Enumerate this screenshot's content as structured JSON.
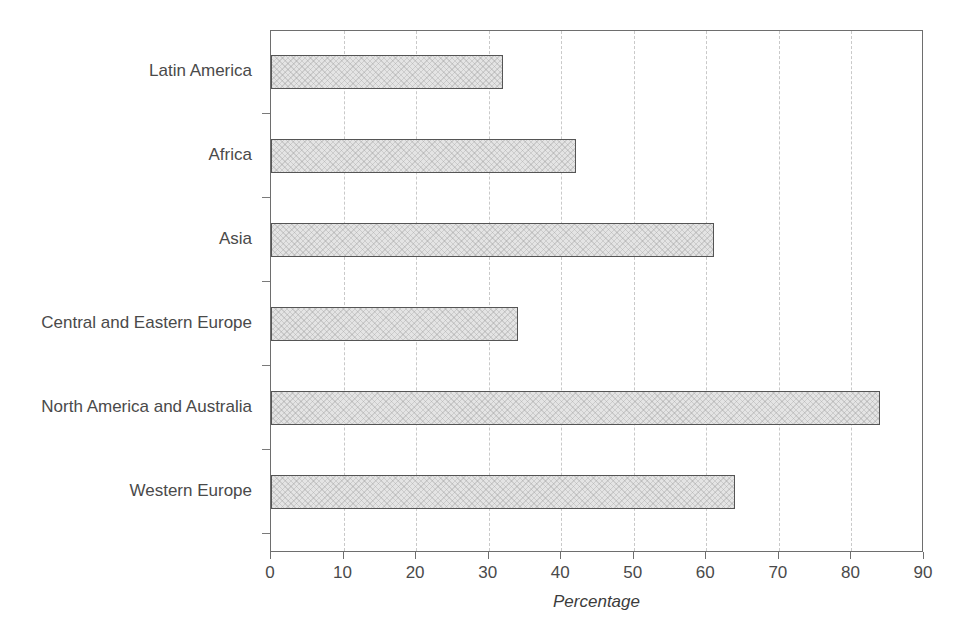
{
  "chart_data": {
    "type": "bar",
    "orientation": "horizontal",
    "title": "",
    "xlabel": "Percentage",
    "ylabel": "",
    "xlim": [
      0,
      90
    ],
    "ylim": null,
    "grid": true,
    "grid_axis": "x",
    "legend": false,
    "legend_position": "none",
    "categories": [
      "Latin America",
      "Africa",
      "Asia",
      "Central and Eastern Europe",
      "North America and Australia",
      "Western Europe"
    ],
    "values": [
      32,
      42,
      61,
      34,
      84,
      64
    ],
    "xticks": [
      0,
      10,
      20,
      30,
      40,
      50,
      60,
      70,
      80,
      90
    ],
    "xtick_labels": [
      "0",
      "10",
      "20",
      "30",
      "40",
      "50",
      "60",
      "70",
      "80",
      "90"
    ],
    "series": [
      {
        "name": "Percentage",
        "values": [
          32,
          42,
          61,
          34,
          84,
          64
        ]
      }
    ]
  },
  "style": {
    "bar_fill": "#e4e4e4",
    "bar_border": "#555555",
    "grid_color": "#c9c9c9",
    "axis_color": "#6e6e6e",
    "text_color": "#4a4a4a",
    "background": "#ffffff"
  }
}
